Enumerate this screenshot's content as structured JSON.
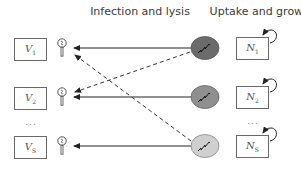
{
  "titles": {
    "left": "Infection and lysis",
    "right": "Uptake and growth"
  },
  "viruses": [
    {
      "symbol": "V",
      "index": "1"
    },
    {
      "symbol": "V",
      "index": "2"
    },
    {
      "symbol": "V",
      "index": "S"
    }
  ],
  "hosts": [
    {
      "symbol": "N",
      "index": "1",
      "color": "#6b6b6b"
    },
    {
      "symbol": "N",
      "index": "2",
      "color": "#8f8f8f"
    },
    {
      "symbol": "N",
      "index": "S",
      "color": "#cfcfcf"
    }
  ],
  "ellipsis": "...",
  "edges": {
    "solid": [
      {
        "from": "host-1",
        "to": "virus-1"
      },
      {
        "from": "host-2",
        "to": "virus-2"
      },
      {
        "from": "host-S",
        "to": "virus-S"
      }
    ],
    "dashed": [
      {
        "from": "host-1",
        "to": "virus-2"
      },
      {
        "from": "host-S",
        "to": "virus-1"
      }
    ]
  },
  "icons": {
    "phage": "phage-icon",
    "host_cell": "host-cell-icon",
    "self_loop": "self-loop-arrow-icon"
  }
}
